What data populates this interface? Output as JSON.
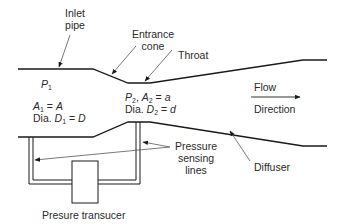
{
  "colors": {
    "line": "#1a1a1a",
    "leader": "#555555",
    "text": "#2a2a2a",
    "background": "#ffffff"
  },
  "labels": {
    "inlet_pipe": [
      "Inlet",
      "pipe"
    ],
    "entrance_cone": [
      "Entrance",
      "cone"
    ],
    "throat": "Throat",
    "flow": "Flow",
    "direction": "Direction",
    "p1": {
      "sym": "P",
      "sub": "1"
    },
    "a1": {
      "sym": "A",
      "sub": "1",
      "rest": " = ",
      "val": "A"
    },
    "d1": {
      "prefix": "Dia. ",
      "sym": "D",
      "sub": "1",
      "rest": " = ",
      "val": "D"
    },
    "p2a2": {
      "p": "P",
      "psub": "2",
      "mid": ", ",
      "a": "A",
      "asub": "2",
      "rest": " = ",
      "val": "a"
    },
    "d2": {
      "prefix": "Dia. ",
      "sym": "D",
      "sub": "2",
      "rest": " = ",
      "val": "d"
    },
    "pressure_sensing": [
      "Pressure",
      "sensing",
      "lines"
    ],
    "diffuser": "Diffuser",
    "transducer": "Presure transucer"
  }
}
